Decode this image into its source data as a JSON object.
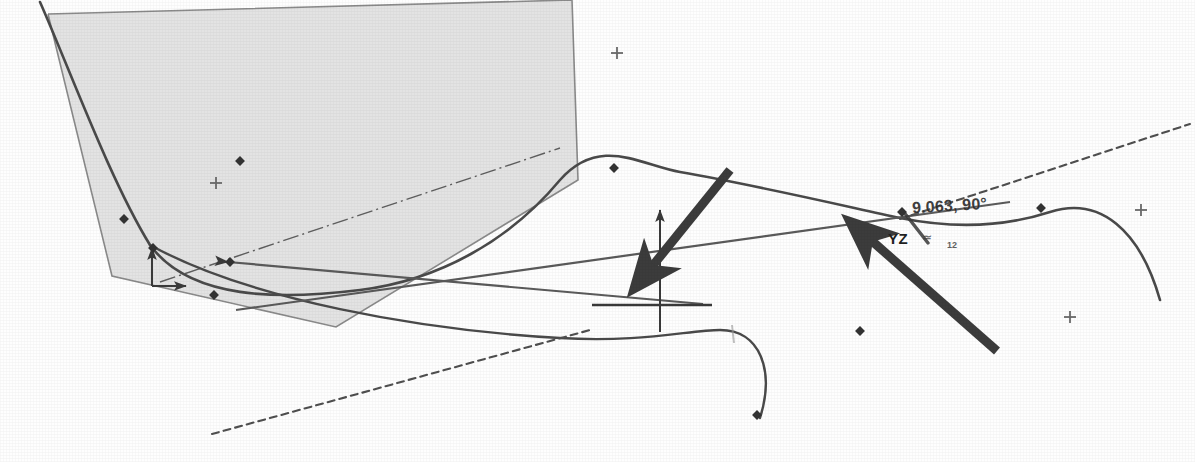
{
  "canvas": {
    "width": 1195,
    "height": 462,
    "background_color": "#fefefe",
    "description": "CAD sketch viewport showing a shaded planar face, spline curves, construction lines and a coordinate origin triad"
  },
  "colors": {
    "face_fill": "#dedede",
    "face_stroke": "#8a8a8a",
    "curve_stroke": "#4a4a4a",
    "construction_stroke": "#6e6e6e",
    "dashed_stroke": "#5a5a5a",
    "annotation_arrow": "#3c3c3c",
    "text_color": "#2c2c2c",
    "node_fill": "#333333"
  },
  "annotations": {
    "dimension_label": "9.063, 90°",
    "plane_label": "YZ",
    "glyph_label": "≃",
    "glyph_subscript": "12"
  },
  "geometry": {
    "shaded_face": {
      "name": "shaded-planar-face",
      "points": "48,14 572,0 578,180 336,327 112,276"
    },
    "face_edges": {
      "name": "face-outline",
      "points": "48,14 572,0 578,180 336,327 112,276 48,14"
    },
    "main_spline": {
      "name": "main-spline-curve",
      "path": "M 40,2 C 70,70 110,180 150,245 C 190,300 280,300 360,290 C 440,280 510,240 560,180 C 600,135 640,165 680,172 C 760,186 840,205 900,218 C 960,230 1010,225 1050,212 C 1100,196 1140,230 1160,300"
    },
    "lower_spline": {
      "name": "lower-spline-curve",
      "path": "M 150,245 C 250,300 420,330 560,338 C 640,343 690,330 720,330 C 760,330 775,370 760,418"
    },
    "construction_line_a": {
      "name": "construction-line-left",
      "x1": 228,
      "y1": 262,
      "x2": 703,
      "y2": 304
    },
    "construction_line_b": {
      "name": "construction-line-right",
      "x1": 236,
      "y1": 310,
      "x2": 1010,
      "y2": 202
    },
    "dashed_line_upper": {
      "name": "dashed-construction-upper",
      "x1": 900,
      "y1": 219,
      "x2": 1190,
      "y2": 124
    },
    "dashed_line_lower": {
      "name": "dashed-construction-lower",
      "x1": 212,
      "y1": 434,
      "x2": 590,
      "y2": 330
    },
    "dashdot_line": {
      "name": "dash-dot-centerline",
      "x1": 160,
      "y1": 282,
      "x2": 560,
      "y2": 148
    },
    "origin": {
      "name": "origin-triad",
      "x": 660,
      "y": 305,
      "axis_up_y": 210,
      "axis_down_y": 332,
      "axis_right_x": 712,
      "axis_left_x": 592
    },
    "secondary_origin": {
      "name": "secondary-origin-triad",
      "x": 152,
      "y": 286
    },
    "callout_arrow_1": {
      "name": "callout-arrow-left",
      "x1": 730,
      "y1": 170,
      "x2": 646,
      "y2": 274
    },
    "callout_arrow_2": {
      "name": "callout-arrow-right",
      "x1": 997,
      "y1": 351,
      "x2": 864,
      "y2": 234
    },
    "leader_line": {
      "name": "dimension-leader-line",
      "x1": 903,
      "y1": 211,
      "x2": 928,
      "y2": 243
    }
  },
  "crosshair_marks": [
    {
      "name": "crosshair-mark-1",
      "x": 617,
      "y": 53
    },
    {
      "name": "crosshair-mark-2",
      "x": 216,
      "y": 183
    },
    {
      "name": "crosshair-mark-3",
      "x": 1141,
      "y": 210
    },
    {
      "name": "crosshair-mark-4",
      "x": 1070,
      "y": 317
    }
  ],
  "curve_nodes": [
    {
      "name": "node-spline-1",
      "x": 214,
      "y": 295
    },
    {
      "name": "node-spline-2",
      "x": 124,
      "y": 219
    },
    {
      "name": "node-spline-3",
      "x": 153,
      "y": 248
    },
    {
      "name": "node-spline-4",
      "x": 240,
      "y": 161
    },
    {
      "name": "node-spline-5",
      "x": 614,
      "y": 168
    },
    {
      "name": "node-spline-6",
      "x": 860,
      "y": 331
    },
    {
      "name": "node-spline-7",
      "x": 1041,
      "y": 208
    },
    {
      "name": "node-spline-8",
      "x": 757,
      "y": 415
    },
    {
      "name": "node-spline-9",
      "x": 230,
      "y": 262
    },
    {
      "name": "node-leader",
      "x": 902,
      "y": 212
    }
  ],
  "tick_marks": [
    {
      "name": "tick-mark-faint",
      "x": 732,
      "y": 334
    }
  ]
}
